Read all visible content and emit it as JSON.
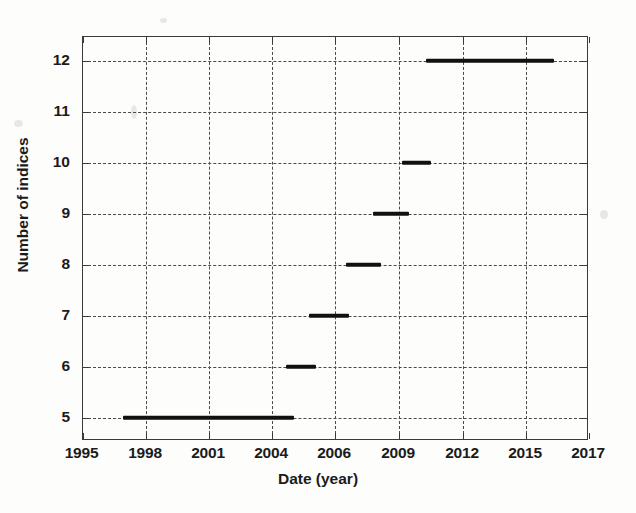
{
  "chart_data": {
    "type": "bar",
    "title": "",
    "xlabel": "Date (year)",
    "ylabel": "Number of indices",
    "grid": true,
    "legend": null,
    "xlim": [
      1995,
      2017
    ],
    "ylim": [
      4.5,
      12.5
    ],
    "xticks": [
      "1995",
      "1998",
      "2001",
      "2004",
      "2006",
      "2009",
      "2012",
      "2015",
      "2017"
    ],
    "yticks": [
      "5",
      "6",
      "7",
      "8",
      "9",
      "10",
      "11",
      "12"
    ],
    "segments": [
      {
        "level": 5,
        "start_year": 1997.8,
        "end_year": 2005.0,
        "x_start_px": 122,
        "x_end_px": 293
      },
      {
        "level": 6,
        "start_year": 2005.0,
        "end_year": 2006.0,
        "x_start_px": 285,
        "x_end_px": 315
      },
      {
        "level": 7,
        "start_year": 2006.0,
        "end_year": 2006.9,
        "x_start_px": 308,
        "x_end_px": 348
      },
      {
        "level": 8,
        "start_year": 2006.9,
        "end_year": 2008.3,
        "x_start_px": 345,
        "x_end_px": 380
      },
      {
        "level": 9,
        "start_year": 2008.3,
        "end_year": 2009.4,
        "x_start_px": 372,
        "x_end_px": 408
      },
      {
        "level": 10,
        "start_year": 2009.4,
        "end_year": 2010.6,
        "x_start_px": 401,
        "x_end_px": 430
      },
      {
        "level": 12,
        "start_year": 2010.6,
        "end_year": 2016.0,
        "x_start_px": 425,
        "x_end_px": 553
      }
    ],
    "series": [
      {
        "name": "Number of indices",
        "values": [
          5,
          6,
          7,
          8,
          9,
          10,
          12
        ]
      }
    ]
  },
  "axis_geometry": {
    "plot_left_px": 81.5,
    "plot_top_px": 36,
    "plot_right_px": 588,
    "plot_bottom_px": 440,
    "xtick_px": [
      81.5,
      145,
      208,
      271,
      334,
      398,
      462,
      525,
      588
    ],
    "ytick_px": [
      59.5,
      110.5,
      161.5,
      212.5,
      263.5,
      314.5,
      365.5,
      416.5
    ]
  },
  "colors": {
    "data": "#111111",
    "axis": "#3a3a3a",
    "grid": "#4a4a4a",
    "background": "#fdfdfc",
    "text": "#1b1b1b"
  }
}
